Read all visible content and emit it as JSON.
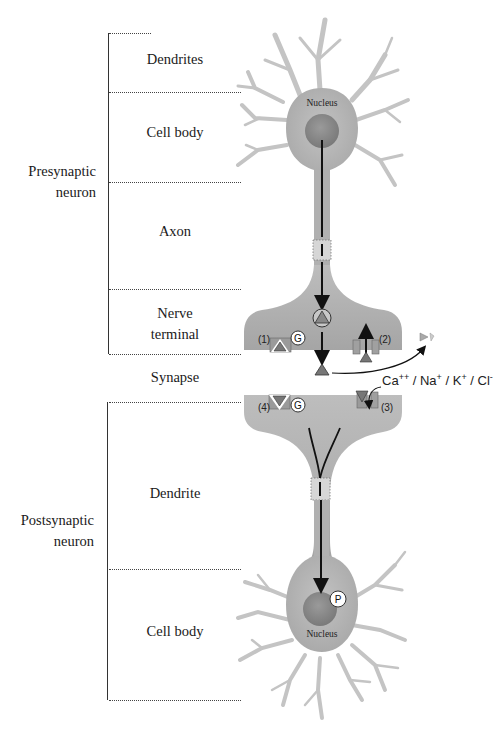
{
  "groups": {
    "presynaptic": {
      "line1": "Presynaptic",
      "line2": "neuron"
    },
    "postsynaptic": {
      "line1": "Postsynaptic",
      "line2": "neuron"
    }
  },
  "regions": {
    "dendrites": "Dendrites",
    "cell_body_top": "Cell body",
    "axon": "Axon",
    "nerve_terminal_1": "Nerve",
    "nerve_terminal_2": "terminal",
    "synapse": "Synapse",
    "dendrite": "Dendrite",
    "cell_body_bottom": "Cell body"
  },
  "neuron_labels": {
    "nucleus_top": "Nucleus",
    "nucleus_bottom": "Nucleus"
  },
  "markers": {
    "site1": "(1)",
    "site2": "(2)",
    "site3": "(3)",
    "site4": "(4)",
    "g_protein_top": "G",
    "g_protein_bottom": "G",
    "phosphate": "P"
  },
  "ions": {
    "ca": "Ca",
    "ca_charge": "++",
    "na": "Na",
    "na_charge": "+",
    "k": "K",
    "k_charge": "+",
    "cl": "Cl",
    "cl_charge": "-",
    "sep": " / "
  },
  "colors": {
    "neuron_fill": "#b3b3b3",
    "nucleus_fill": "#8c8c8c",
    "line": "#222222",
    "dotted": "#444444"
  }
}
